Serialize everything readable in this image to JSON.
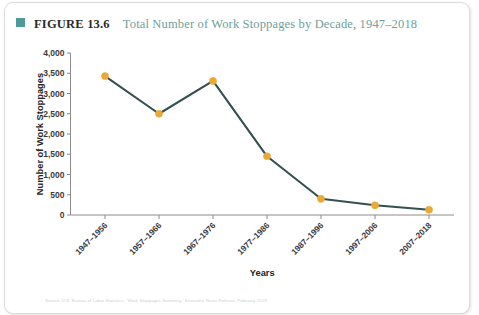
{
  "header": {
    "figure_number": "FIGURE 13.6",
    "figure_title": "Total Number of Work Stoppages by Decade, 1947–2018",
    "swatch_color": "#4d9a98",
    "title_color": "#6f9e9c"
  },
  "source_note": "Source: U.S. Bureau of Labor Statistics, “Work Stoppages Summary,” Economic News Release, February 2019.",
  "chart_data": {
    "type": "line",
    "title": "Total Number of Work Stoppages by Decade, 1947–2018",
    "xlabel": "Years",
    "ylabel": "Number of Work Stoppages",
    "categories": [
      "1947–1956",
      "1957–1966",
      "1967–1976",
      "1977–1986",
      "1987–1996",
      "1997–2006",
      "2007–2018"
    ],
    "values": [
      3430,
      2500,
      3310,
      1450,
      400,
      240,
      130
    ],
    "ylim": [
      0,
      4000
    ],
    "ytick_labels": [
      "0",
      "500",
      "1,000",
      "1,500",
      "2,000",
      "2,500",
      "3,000",
      "3,500",
      "4,000"
    ],
    "ytick_values": [
      0,
      500,
      1000,
      1500,
      2000,
      2500,
      3000,
      3500,
      4000
    ],
    "grid": false,
    "legend": false,
    "line_color": "#34504f",
    "marker_color": "#eaa937",
    "axis_color": "#8b8b8b"
  }
}
